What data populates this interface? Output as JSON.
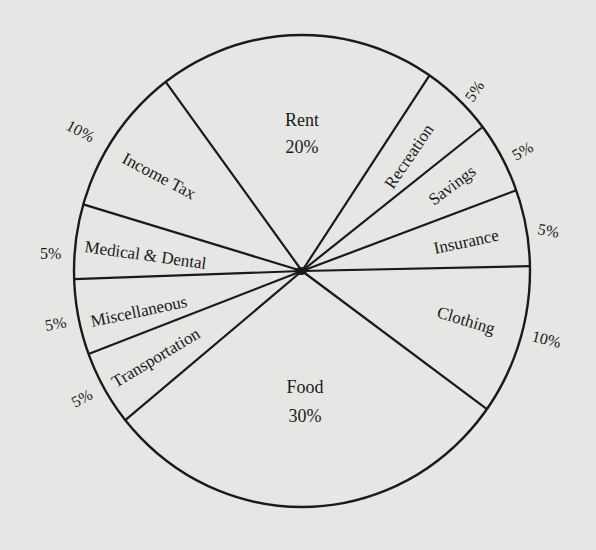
{
  "chart_data": {
    "type": "pie",
    "title": "",
    "slices": [
      {
        "label": "Rent",
        "value": 20,
        "percent_label": "20%"
      },
      {
        "label": "Recreation",
        "value": 5,
        "percent_label": "5%"
      },
      {
        "label": "Savings",
        "value": 5,
        "percent_label": "5%"
      },
      {
        "label": "Insurance",
        "value": 5,
        "percent_label": "5%"
      },
      {
        "label": "Clothing",
        "value": 10,
        "percent_label": "10%"
      },
      {
        "label": "Food",
        "value": 30,
        "percent_label": "30%"
      },
      {
        "label": "Transportation",
        "value": 5,
        "percent_label": "5%"
      },
      {
        "label": "Miscellaneous",
        "value": 5,
        "percent_label": "5%"
      },
      {
        "label": "Medical & Dental",
        "value": 5,
        "percent_label": "5%"
      },
      {
        "label": "Income Tax",
        "value": 10,
        "percent_label": "10%"
      }
    ],
    "legend": "none",
    "colors": {
      "background": "#e6e6e4",
      "ink": "#1a1a1a"
    }
  }
}
